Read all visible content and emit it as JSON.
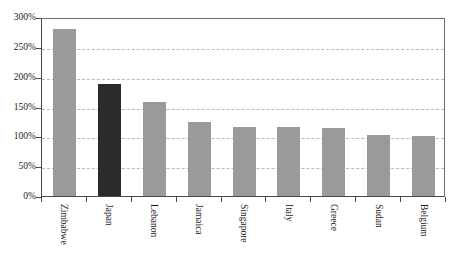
{
  "chart_data": {
    "type": "bar",
    "title": "",
    "subtitle": "",
    "xlabel": "",
    "ylabel": "",
    "categories": [
      "Zimbabwe",
      "Japan",
      "Lebanon",
      "Jamaica",
      "Singapore",
      "Italy",
      "Greece",
      "Sudan",
      "Belgium"
    ],
    "values": [
      280,
      188,
      157,
      124,
      116,
      116,
      114,
      103,
      100
    ],
    "value_suffix": "%",
    "ylim": [
      0,
      300
    ],
    "ytick_values": [
      0,
      50,
      100,
      150,
      200,
      250,
      300
    ],
    "ytick_labels": [
      "0%",
      "50%",
      "100%",
      "150%",
      "200%",
      "250%",
      "300%"
    ],
    "grid": true,
    "grid_axis": "y",
    "grid_style": "dashed",
    "legend": false,
    "legend_position": "none",
    "bar_colors": [
      "#9a9a9a",
      "#2b2b2b",
      "#9a9a9a",
      "#9a9a9a",
      "#9a9a9a",
      "#9a9a9a",
      "#9a9a9a",
      "#9a9a9a",
      "#9a9a9a"
    ],
    "highlight_category": "Japan",
    "series": [
      {
        "name": "Gross government debt to GDP",
        "values": [
          280,
          188,
          157,
          124,
          116,
          116,
          114,
          103,
          100
        ]
      }
    ],
    "colors": {
      "bar_default": "#9a9a9a",
      "bar_highlight": "#2b2b2b",
      "gridline": "#b9b9b9",
      "axis": "#4a4a4a",
      "frame": "#6e6e6e",
      "background": "#ffffff",
      "text": "#1a1a1a"
    }
  }
}
